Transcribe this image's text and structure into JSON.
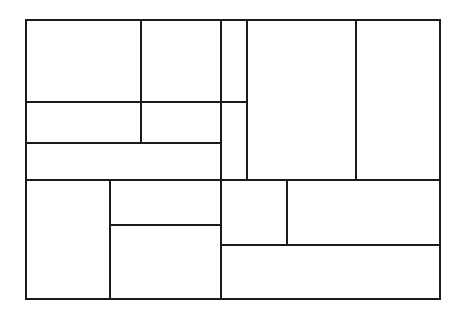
{
  "diagram": {
    "type": "rectangle-partition",
    "stroke_color": "#1a1a1a",
    "background": "#ffffff",
    "outer_frame": {
      "x1": 26,
      "y1": 20,
      "x2": 440,
      "y2": 299
    },
    "horizontal_lines": [
      {
        "y": 102,
        "x1": 26,
        "x2": 247
      },
      {
        "y": 143,
        "x1": 26,
        "x2": 221
      },
      {
        "y": 180,
        "x1": 26,
        "x2": 440
      },
      {
        "y": 225,
        "x1": 110,
        "x2": 221
      },
      {
        "y": 245,
        "x1": 221,
        "x2": 440
      }
    ],
    "vertical_lines": [
      {
        "x": 141,
        "y1": 20,
        "y2": 143
      },
      {
        "x": 221,
        "y1": 20,
        "y2": 299
      },
      {
        "x": 247,
        "y1": 20,
        "y2": 180
      },
      {
        "x": 356,
        "y1": 20,
        "y2": 180
      },
      {
        "x": 110,
        "y1": 180,
        "y2": 299
      },
      {
        "x": 287,
        "y1": 180,
        "y2": 245
      }
    ]
  }
}
